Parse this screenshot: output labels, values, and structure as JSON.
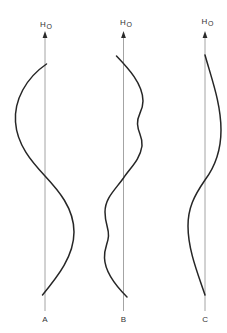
{
  "diagram": {
    "colors": {
      "axis": "#9a9a9a",
      "curve": "#262626",
      "text": "#333333",
      "background": "#ffffff"
    },
    "panels": [
      {
        "id": "A",
        "label": "A",
        "axis_label_main": "H",
        "axis_label_sub": "O",
        "axis_x": 45,
        "shape": "single smooth S-curve: bulges left in upper half, right in lower half"
      },
      {
        "id": "B",
        "label": "B",
        "axis_label_main": "H",
        "axis_label_sub": "O",
        "axis_x": 123,
        "shape": "wavy S-curve: bulges right with ripples in upper half, left with ripples in lower half"
      },
      {
        "id": "C",
        "label": "C",
        "axis_label_main": "H",
        "axis_label_sub": "O",
        "axis_x": 205,
        "shape": "single smooth S-curve: bulges right in upper half, left in lower half"
      }
    ]
  }
}
